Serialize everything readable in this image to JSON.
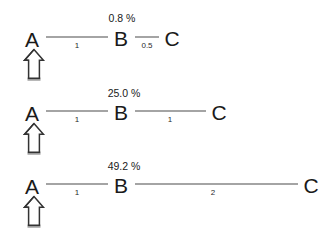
{
  "figure": {
    "type": "diagram",
    "background_color": "#ffffff",
    "node_color": "#1a1a1a",
    "edge_color": "#4a4a4a",
    "arrow_outline_color": "#333333",
    "arrow_base_color": "#9a9a9a"
  },
  "rows": [
    {
      "id": "row-1",
      "percent_label": "0.8 %",
      "marked_node": "A",
      "arrow_icon": "up-arrow-icon",
      "nodes": [
        {
          "label": "A",
          "x": 32,
          "y": 39
        },
        {
          "label": "B",
          "x": 121,
          "y": 38
        },
        {
          "label": "C",
          "x": 172,
          "y": 38
        }
      ],
      "edges": [
        {
          "from": "A",
          "to": "B",
          "weight": "1",
          "x1": 46,
          "y1": 37,
          "x2": 108,
          "label_x": 77,
          "label_y": 42
        },
        {
          "from": "B",
          "to": "C",
          "weight": "0.5",
          "x1": 135,
          "y1": 37,
          "x2": 159,
          "label_x": 147,
          "label_y": 42
        }
      ],
      "percent_x": 122,
      "percent_y": 13
    },
    {
      "id": "row-2",
      "percent_label": "25.0 %",
      "marked_node": "A",
      "arrow_icon": "up-arrow-icon",
      "nodes": [
        {
          "label": "A",
          "x": 32,
          "y": 113
        },
        {
          "label": "B",
          "x": 121,
          "y": 112
        },
        {
          "label": "C",
          "x": 219,
          "y": 112
        }
      ],
      "edges": [
        {
          "from": "A",
          "to": "B",
          "weight": "1",
          "x1": 46,
          "y1": 111,
          "x2": 108,
          "label_x": 77,
          "label_y": 116
        },
        {
          "from": "B",
          "to": "C",
          "weight": "1",
          "x1": 135,
          "y1": 111,
          "x2": 206,
          "label_x": 170,
          "label_y": 116
        }
      ],
      "percent_x": 124,
      "percent_y": 88
    },
    {
      "id": "row-3",
      "percent_label": "49.2 %",
      "marked_node": "A",
      "arrow_icon": "up-arrow-icon",
      "nodes": [
        {
          "label": "A",
          "x": 32,
          "y": 186
        },
        {
          "label": "B",
          "x": 121,
          "y": 185
        },
        {
          "label": "C",
          "x": 311,
          "y": 185
        }
      ],
      "edges": [
        {
          "from": "A",
          "to": "B",
          "weight": "1",
          "x1": 46,
          "y1": 184,
          "x2": 108,
          "label_x": 77,
          "label_y": 189
        },
        {
          "from": "B",
          "to": "C",
          "weight": "2",
          "x1": 135,
          "y1": 184,
          "x2": 298,
          "label_x": 213,
          "label_y": 189
        }
      ],
      "percent_x": 124,
      "percent_y": 161
    }
  ],
  "arrows": [
    {
      "icon": "up-arrow-icon",
      "x": 21,
      "y": 48
    },
    {
      "icon": "up-arrow-icon",
      "x": 21,
      "y": 122
    },
    {
      "icon": "up-arrow-icon",
      "x": 21,
      "y": 195
    }
  ]
}
